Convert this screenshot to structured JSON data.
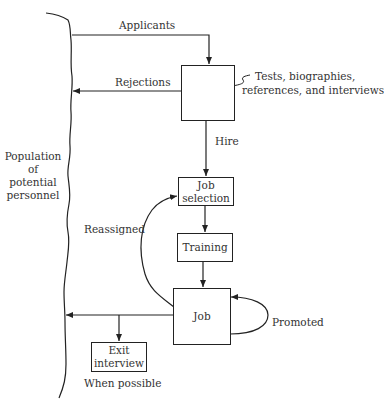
{
  "diagram": {
    "boundary_label": [
      "Population",
      "of",
      "potential",
      "personnel"
    ],
    "flows": {
      "applicants": "Applicants",
      "rejections": "Rejections",
      "hire": "Hire",
      "reassigned": "Reassigned",
      "promoted": "Promoted",
      "when_possible": "When possible"
    },
    "screening_note": [
      "Tests, biographies,",
      "references, and interviews"
    ],
    "boxes": {
      "screening": "",
      "job_selection": [
        "Job",
        "selection"
      ],
      "training": "Training",
      "job": "Job",
      "exit_interview": [
        "Exit",
        "interview"
      ]
    }
  }
}
